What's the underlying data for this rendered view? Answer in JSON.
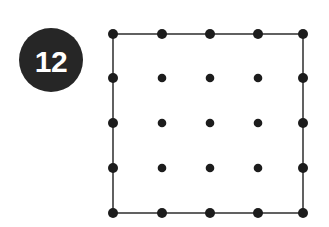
{
  "figure": {
    "label": "Dot grid with bounding square",
    "background_color": "#ffffff",
    "width": 329,
    "height": 227
  },
  "badge": {
    "number": "12",
    "shape": "circle",
    "center_x": 51,
    "center_y": 60,
    "radius": 32,
    "fill_color": "#262626",
    "text_color": "#ffffff"
  },
  "chart_data": {
    "type": "scatter",
    "title": "",
    "subtitle": "",
    "xlabel": "",
    "ylabel": "",
    "grid": false,
    "legend": null,
    "xlim": [
      113,
      303
    ],
    "ylim": [
      34,
      213
    ],
    "rows": 5,
    "columns": 5,
    "total_points": 25,
    "column_x": [
      113,
      162,
      210,
      258,
      303
    ],
    "row_y": [
      34,
      78,
      123,
      168,
      213
    ],
    "perimeter_point_radius": 5,
    "interior_point_radius": 4.3,
    "point_color": "#1c1c1c",
    "outline": {
      "shape": "square",
      "stroke_color": "#3a3a3a",
      "stroke_width": 1.6,
      "x": 113,
      "y": 34,
      "width": 190,
      "height": 179
    },
    "points": [
      {
        "x": 113,
        "y": 34,
        "perimeter": true
      },
      {
        "x": 162,
        "y": 34,
        "perimeter": true
      },
      {
        "x": 210,
        "y": 34,
        "perimeter": true
      },
      {
        "x": 258,
        "y": 34,
        "perimeter": true
      },
      {
        "x": 303,
        "y": 34,
        "perimeter": true
      },
      {
        "x": 113,
        "y": 78,
        "perimeter": true
      },
      {
        "x": 162,
        "y": 78,
        "perimeter": false
      },
      {
        "x": 210,
        "y": 78,
        "perimeter": false
      },
      {
        "x": 258,
        "y": 78,
        "perimeter": false
      },
      {
        "x": 303,
        "y": 78,
        "perimeter": true
      },
      {
        "x": 113,
        "y": 123,
        "perimeter": true
      },
      {
        "x": 162,
        "y": 123,
        "perimeter": false
      },
      {
        "x": 210,
        "y": 123,
        "perimeter": false
      },
      {
        "x": 258,
        "y": 123,
        "perimeter": false
      },
      {
        "x": 303,
        "y": 123,
        "perimeter": true
      },
      {
        "x": 113,
        "y": 168,
        "perimeter": true
      },
      {
        "x": 162,
        "y": 168,
        "perimeter": false
      },
      {
        "x": 210,
        "y": 168,
        "perimeter": false
      },
      {
        "x": 258,
        "y": 168,
        "perimeter": false
      },
      {
        "x": 303,
        "y": 168,
        "perimeter": true
      },
      {
        "x": 113,
        "y": 213,
        "perimeter": true
      },
      {
        "x": 162,
        "y": 213,
        "perimeter": true
      },
      {
        "x": 210,
        "y": 213,
        "perimeter": true
      },
      {
        "x": 258,
        "y": 213,
        "perimeter": true
      },
      {
        "x": 303,
        "y": 213,
        "perimeter": true
      }
    ]
  }
}
